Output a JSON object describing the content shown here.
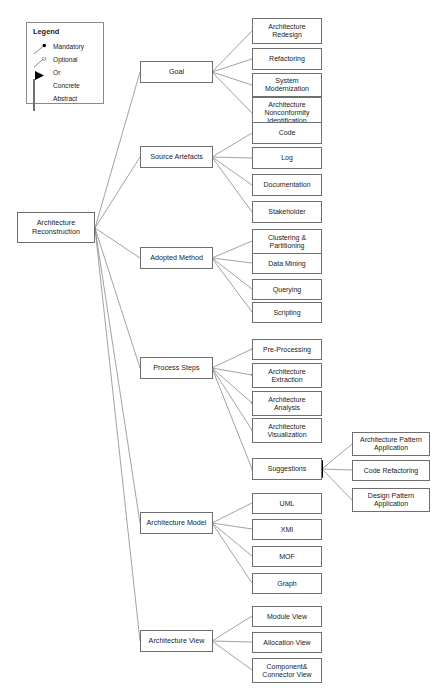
{
  "diagram": {
    "root": {
      "label": "Architecture Reconstruction"
    },
    "legend": {
      "title": "Legend",
      "items": [
        {
          "symbol": "mandatory-filled-circle",
          "label": "Mandatory"
        },
        {
          "symbol": "optional-open-circle",
          "label": "Optional"
        },
        {
          "symbol": "or-filled-triangle",
          "label": "Or"
        },
        {
          "symbol": "concrete-white-box",
          "label": "Concrete"
        },
        {
          "symbol": "abstract-gray-box",
          "label": "Abstract"
        }
      ]
    },
    "branches": [
      {
        "label": "Goal",
        "relation": "or",
        "edge_marker": "mandatory",
        "children": [
          {
            "label": "Architecture Redesign"
          },
          {
            "label": "Refactoring"
          },
          {
            "label": "System Modernization"
          },
          {
            "label": "Architecture Nonconformity Identification"
          }
        ]
      },
      {
        "label": "Source Artefacts",
        "relation": "or",
        "edge_marker": "mandatory",
        "children": [
          {
            "label": "Code"
          },
          {
            "label": "Log"
          },
          {
            "label": "Documentation"
          },
          {
            "label": "Stakeholder"
          }
        ]
      },
      {
        "label": "Adopted Method",
        "relation": "or",
        "edge_marker": "mandatory",
        "children": [
          {
            "label": "Clustering & Partitioning"
          },
          {
            "label": "Data Mining"
          },
          {
            "label": "Querying"
          },
          {
            "label": "Scripting"
          }
        ]
      },
      {
        "label": "Process Steps",
        "relation": "and",
        "edge_marker": "mandatory",
        "children": [
          {
            "label": "Pre-Processing",
            "edge_marker": "optional"
          },
          {
            "label": "Architecture Extraction",
            "edge_marker": "mandatory"
          },
          {
            "label": "Architecture Analysis",
            "edge_marker": "mandatory"
          },
          {
            "label": "Architecture Visualization",
            "edge_marker": "optional"
          },
          {
            "label": "Suggestions",
            "edge_marker": "optional",
            "relation": "or",
            "children": [
              {
                "label": "Architecture Pattern Application"
              },
              {
                "label": "Code Refactoring"
              },
              {
                "label": "Design Pattern Application"
              }
            ]
          }
        ]
      },
      {
        "label": "Architecture Model",
        "relation": "or",
        "edge_marker": "mandatory",
        "children": [
          {
            "label": "UML"
          },
          {
            "label": "XMI"
          },
          {
            "label": "MOF"
          },
          {
            "label": "Graph"
          }
        ]
      },
      {
        "label": "Architecture View",
        "relation": "or",
        "edge_marker": "mandatory",
        "children": [
          {
            "label": "Module View"
          },
          {
            "label": "Allocation View"
          },
          {
            "label": "Component& Connector View"
          }
        ]
      }
    ]
  },
  "colors": {
    "node_border": "#6f6f6f",
    "node_fill": "#ffffff",
    "edge": "#7a7a7a",
    "marker_fill": "#000000",
    "abstract_fill": "#9b9b9b"
  }
}
